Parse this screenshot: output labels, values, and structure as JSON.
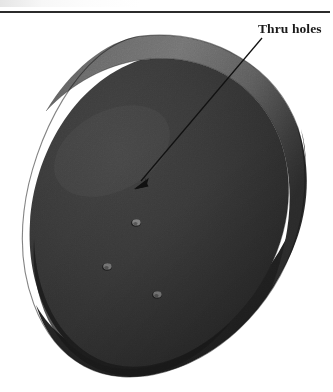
{
  "figure": {
    "kind": "photograph",
    "width_px": 333,
    "height_px": 392,
    "background_color": "#ffffff"
  },
  "rule": {
    "present": true,
    "color": "#2b2b2b"
  },
  "annotation": {
    "label": "Thru holes",
    "label_color": "#1a1a1a",
    "leader_line_color": "#111111",
    "leader_start": {
      "x": 262,
      "y": 38
    },
    "leader_end": {
      "x": 136,
      "y": 187
    },
    "arrowhead": "solid-filled"
  },
  "part": {
    "name": "disc",
    "top_face_color": "#3a3a3a",
    "top_face_shadow_color": "#2a2a2a",
    "rim_light_color": "#6d6d6d",
    "rim_mid_color": "#5a5a5a",
    "side_wall_color": "#242424",
    "outline_color": "#1c1c1c",
    "holes": [
      {
        "name": "thru-hole-1",
        "cx": 136,
        "cy": 190,
        "rx": 4.6,
        "ry": 3.4,
        "color": "#7c7c7c"
      },
      {
        "name": "thru-hole-2",
        "cx": 107,
        "cy": 234,
        "rx": 4.6,
        "ry": 3.4,
        "color": "#6f6f6f"
      },
      {
        "name": "thru-hole-3",
        "cx": 157,
        "cy": 262,
        "rx": 4.6,
        "ry": 3.4,
        "color": "#6a6a6a"
      }
    ],
    "hole_count": 3
  }
}
